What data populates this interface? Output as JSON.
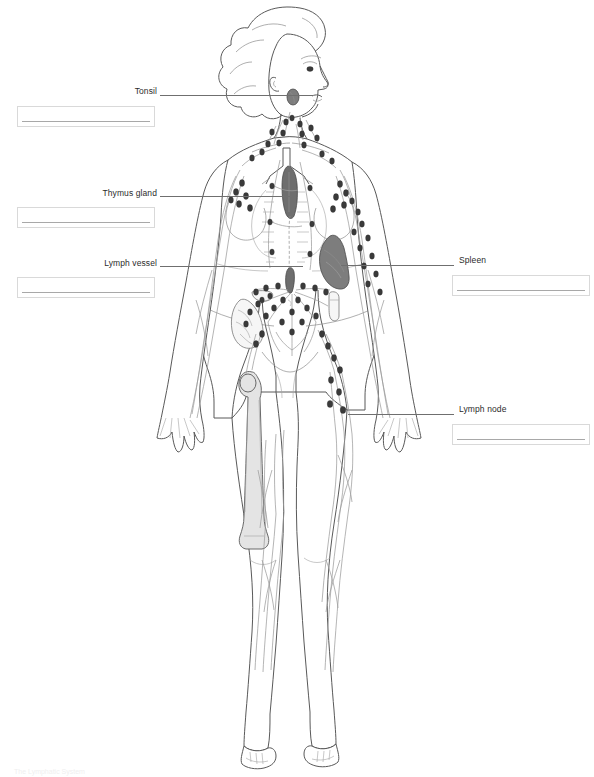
{
  "document": {
    "type": "anatomy-worksheet",
    "title": "The Lymphatic System",
    "subject": "Human lymphatic system labeling diagram",
    "background_color": "#ffffff",
    "footer_note": "The Lymphatic System"
  },
  "figure": {
    "name": "human-body-lymphatic-system",
    "view": "anterior full-body female figure, head in profile",
    "line_color": "#555555",
    "node_color": "#3a3a3a",
    "vessel_color": "#9a9a9a",
    "organs": [
      {
        "name": "thymus-gland",
        "color": "#6e6e6e",
        "location": "upper-chest-midline"
      },
      {
        "name": "spleen",
        "color": "#7a7a7a",
        "location": "left-upper-abdomen"
      },
      {
        "name": "cisterna-chyli",
        "color": "#6e6e6e",
        "location": "mid-abdomen-midline"
      },
      {
        "name": "tonsil",
        "color": "#8c8c8c",
        "location": "throat-behind-jaw"
      },
      {
        "name": "bone-marrow-femur",
        "color": "#e2e2e2",
        "location": "right-thigh"
      },
      {
        "name": "intestines-peyers-patches",
        "color": "#f4f4f4",
        "location": "lower-abdomen-left"
      }
    ]
  },
  "callouts": [
    {
      "id": "tonsil",
      "label": "Tonsil",
      "side": "left",
      "label_x": 152,
      "label_y": 88,
      "box_x": 17,
      "box_y": 106,
      "leader_x": 160,
      "leader_y": 95,
      "leader_width": 153,
      "answer_value": ""
    },
    {
      "id": "thymus-gland",
      "label": "Thymus gland",
      "side": "left",
      "label_x": 152,
      "label_y": 190,
      "box_x": 17,
      "box_y": 205,
      "leader_x": 160,
      "leader_y": 196,
      "leader_width": 132,
      "answer_value": ""
    },
    {
      "id": "lymph-vessel",
      "label": "Lymph vessel",
      "side": "left",
      "label_x": 152,
      "label_y": 259,
      "box_x": 17,
      "box_y": 276,
      "leader_x": 160,
      "leader_y": 266,
      "leader_width": 143,
      "answer_value": ""
    },
    {
      "id": "spleen",
      "label": "Spleen",
      "side": "right",
      "label_x": 459,
      "label_y": 258,
      "box_x": 452,
      "box_y": 274,
      "leader_x": 341,
      "leader_y": 265,
      "leader_width": 113,
      "answer_value": ""
    },
    {
      "id": "lymph-node",
      "label": "Lymph node",
      "side": "right",
      "label_x": 459,
      "label_y": 407,
      "box_x": 452,
      "box_y": 423,
      "leader_x": 348,
      "leader_y": 414,
      "leader_width": 106,
      "answer_value": ""
    }
  ]
}
